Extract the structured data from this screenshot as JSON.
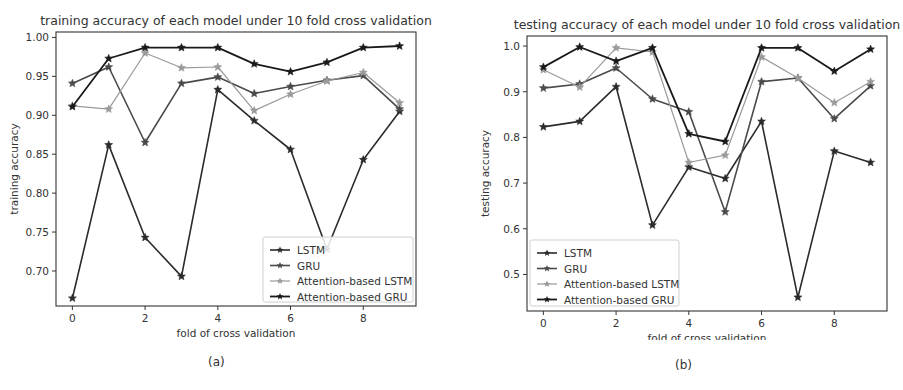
{
  "figure": {
    "captions": [
      "(a)",
      "(b)"
    ]
  },
  "chart_data": [
    {
      "type": "line",
      "title": "training accuracy of each model under 10 fold cross validation",
      "xlabel": "fold of cross validation",
      "ylabel": "training accuracy",
      "x": [
        0,
        1,
        2,
        3,
        4,
        5,
        6,
        7,
        8,
        9
      ],
      "xticks": [
        0,
        2,
        4,
        6,
        8
      ],
      "yticks": [
        0.7,
        0.75,
        0.8,
        0.85,
        0.9,
        0.95,
        1.0
      ],
      "ytick_labels": [
        "0.70",
        "0.75",
        "0.80",
        "0.85",
        "0.90",
        "0.95",
        "1.00"
      ],
      "xlim": [
        -0.45,
        9.45
      ],
      "ylim": [
        0.655,
        1.007
      ],
      "grid": false,
      "legend_position": "lower right",
      "series": [
        {
          "name": "LSTM",
          "color": "#2b2b2b",
          "values": [
            0.665,
            0.862,
            0.743,
            0.693,
            0.933,
            0.893,
            0.856,
            0.728,
            0.843,
            0.905
          ]
        },
        {
          "name": "GRU",
          "color": "#4a4a4a",
          "values": [
            0.941,
            0.962,
            0.865,
            0.941,
            0.949,
            0.928,
            0.937,
            0.945,
            0.951,
            0.908
          ]
        },
        {
          "name": "Attention-based LSTM",
          "color": "#9a9a9a",
          "values": [
            0.912,
            0.908,
            0.98,
            0.961,
            0.962,
            0.906,
            0.927,
            0.944,
            0.955,
            0.916
          ]
        },
        {
          "name": "Attention-based GRU",
          "color": "#1a1a1a",
          "values": [
            0.911,
            0.973,
            0.987,
            0.987,
            0.987,
            0.966,
            0.956,
            0.968,
            0.987,
            0.989
          ]
        }
      ]
    },
    {
      "type": "line",
      "title": "testing accuracy of each model under 10 fold cross validation",
      "xlabel": "fold of cross validation",
      "ylabel": "testing accuracy",
      "x": [
        0,
        1,
        2,
        3,
        4,
        5,
        6,
        7,
        8,
        9
      ],
      "xticks": [
        0,
        2,
        4,
        6,
        8
      ],
      "yticks": [
        0.5,
        0.6,
        0.7,
        0.8,
        0.9,
        1.0
      ],
      "ytick_labels": [
        "0.5",
        "0.6",
        "0.7",
        "0.8",
        "0.9",
        "1.0"
      ],
      "xlim": [
        -0.45,
        9.45
      ],
      "ylim": [
        0.42,
        1.022
      ],
      "grid": false,
      "legend_position": "lower left",
      "series": [
        {
          "name": "LSTM",
          "color": "#2b2b2b",
          "values": [
            0.823,
            0.835,
            0.911,
            0.608,
            0.735,
            0.71,
            0.835,
            0.45,
            0.77,
            0.745
          ]
        },
        {
          "name": "GRU",
          "color": "#4a4a4a",
          "values": [
            0.908,
            0.917,
            0.952,
            0.884,
            0.856,
            0.637,
            0.922,
            0.93,
            0.841,
            0.913
          ]
        },
        {
          "name": "Attention-based LSTM",
          "color": "#9a9a9a",
          "values": [
            0.948,
            0.91,
            0.996,
            0.987,
            0.745,
            0.761,
            0.976,
            0.93,
            0.876,
            0.922
          ]
        },
        {
          "name": "Attention-based GRU",
          "color": "#1a1a1a",
          "values": [
            0.954,
            0.998,
            0.967,
            0.996,
            0.808,
            0.791,
            0.996,
            0.996,
            0.945,
            0.993
          ]
        }
      ]
    }
  ]
}
